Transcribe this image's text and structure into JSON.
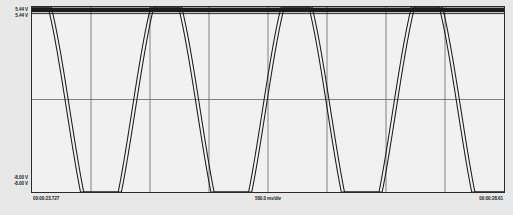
{
  "display": {
    "kind": "oscilloscope-waveform",
    "background_color": "#e9e9e9",
    "plot_background_color": "#f2f2f2",
    "border_color": "#2a2a2a",
    "grid_color": "#6e6e6e",
    "trace_color": "#1a1a1a"
  },
  "y_axis": {
    "max_label_a": "5.44 V",
    "max_label_b": "5.44 V",
    "min_label_a": "-8.00 V",
    "min_label_b": "-8.00 V"
  },
  "x_axis": {
    "start_time": "00:00:23.727",
    "time_per_div": "500.0 ms/div",
    "end_time": "00:00:28.61"
  },
  "chart_data": {
    "type": "line",
    "title": "",
    "xlabel": "500.0 ms/div",
    "ylabel": "V",
    "ylim": [
      -8.0,
      5.44
    ],
    "xlim": [
      23.727,
      28.61
    ],
    "grid": true,
    "grid_x_divisions": 8,
    "grid_y_divisions": 2,
    "legend": "none",
    "clipped_at_top": true,
    "clip_level": 5.44,
    "annotations": [
      "Both traces saturate (clip flat) at the 5.44 V rail",
      "Traces are nearly coincident with a small horizontal skew"
    ],
    "series": [
      {
        "name": "Channel A",
        "color": "#1a1a1a",
        "waveform": "clipped-sine",
        "amplitude": 9.6,
        "offset": -2.1,
        "cycles": 3.62,
        "phase_deg": 84,
        "skew_px": 0
      },
      {
        "name": "Channel B",
        "color": "#1a1a1a",
        "waveform": "clipped-sine",
        "amplitude": 9.6,
        "offset": -2.1,
        "cycles": 3.62,
        "phase_deg": 84,
        "skew_px": 3.2
      }
    ],
    "x_tick_labels": [
      "00:00:23.727",
      "",
      "",
      "",
      "500.0 ms/div",
      "",
      "",
      "",
      "00:00:28.61"
    ],
    "y_tick_labels": [
      "5.44 V",
      "",
      "-8.00 V"
    ]
  }
}
